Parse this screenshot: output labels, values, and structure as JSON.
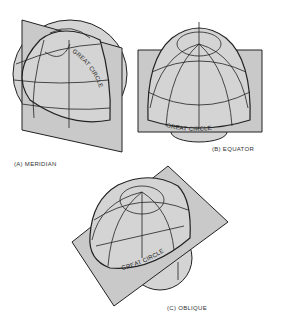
{
  "figure": {
    "panels": [
      {
        "id": "A",
        "caption": "(A) MERIDIAN",
        "great_circle_label": "GREAT CIRCLE"
      },
      {
        "id": "B",
        "caption": "(B) EQUATOR",
        "great_circle_label": "GREAT CIRCLE"
      },
      {
        "id": "C",
        "caption": "(C) OBLIQUE",
        "great_circle_label": "GREAT CIRCLE"
      }
    ],
    "colors": {
      "plane": "#c9c9c9",
      "globe": "#d4d4d4",
      "line": "#222222"
    }
  }
}
